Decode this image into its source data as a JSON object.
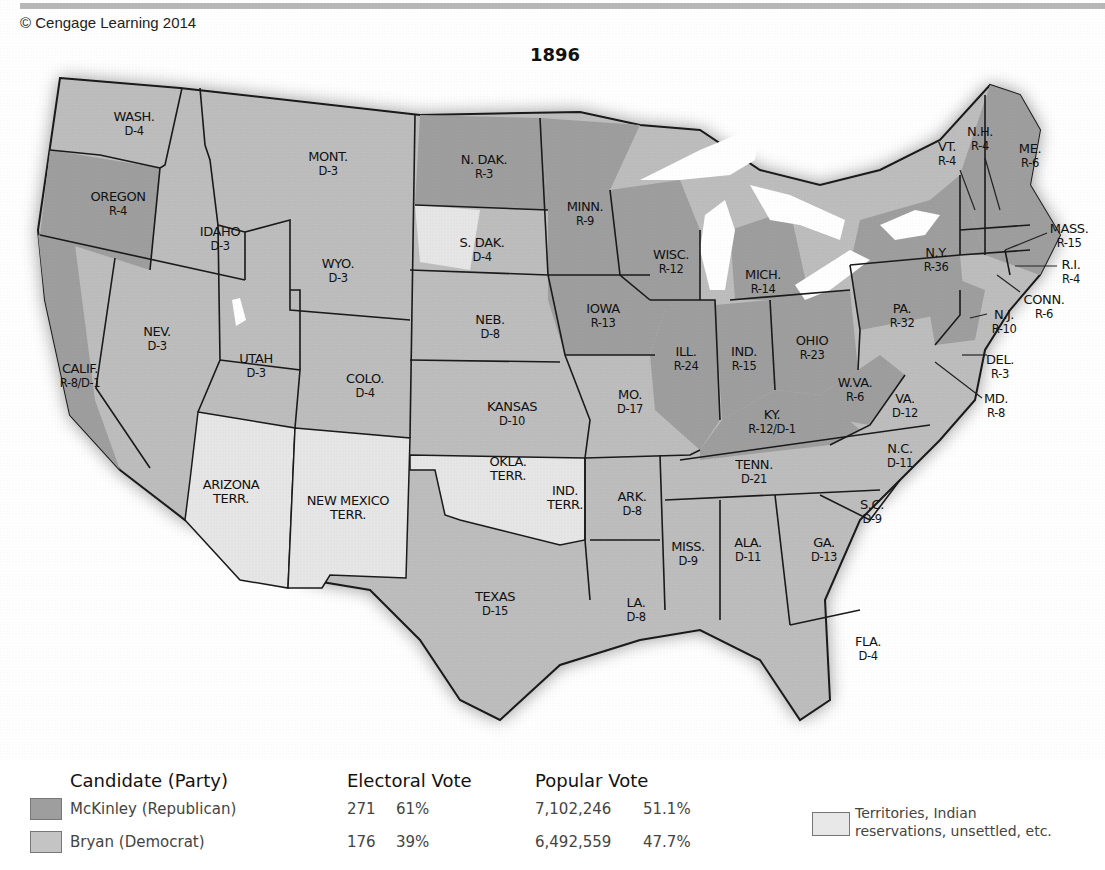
{
  "header": {
    "copyright": "© Cengage Learning 2014"
  },
  "map": {
    "title": "1896",
    "colors": {
      "republican": "#9e9e9e",
      "democrat": "#bdbdbd",
      "territory": "#e6e6e6",
      "water": "#ffffff",
      "border": "#1a1a1a"
    },
    "states": [
      {
        "name": "WASH.",
        "result": "D-4"
      },
      {
        "name": "OREGON",
        "result": "R-4"
      },
      {
        "name": "CALIF.",
        "result": "R-8/D-1"
      },
      {
        "name": "IDAHO",
        "result": "D-3"
      },
      {
        "name": "NEV.",
        "result": "D-3"
      },
      {
        "name": "MONT.",
        "result": "D-3"
      },
      {
        "name": "WYO.",
        "result": "D-3"
      },
      {
        "name": "UTAH",
        "result": "D-3"
      },
      {
        "name": "COLO.",
        "result": "D-4"
      },
      {
        "name": "ARIZONA",
        "result": "TERR."
      },
      {
        "name": "NEW MEXICO",
        "result": "TERR."
      },
      {
        "name": "N. DAK.",
        "result": "R-3"
      },
      {
        "name": "S. DAK.",
        "result": "D-4"
      },
      {
        "name": "NEB.",
        "result": "D-8"
      },
      {
        "name": "KANSAS",
        "result": "D-10"
      },
      {
        "name": "OKLA.",
        "result": "TERR."
      },
      {
        "name": "IND.",
        "result": "TERR."
      },
      {
        "name": "TEXAS",
        "result": "D-15"
      },
      {
        "name": "MINN.",
        "result": "R-9"
      },
      {
        "name": "IOWA",
        "result": "R-13"
      },
      {
        "name": "MO.",
        "result": "D-17"
      },
      {
        "name": "ARK.",
        "result": "D-8"
      },
      {
        "name": "LA.",
        "result": "D-8"
      },
      {
        "name": "WISC.",
        "result": "R-12"
      },
      {
        "name": "ILL.",
        "result": "R-24"
      },
      {
        "name": "MICH.",
        "result": "R-14"
      },
      {
        "name": "IND.",
        "result": "R-15"
      },
      {
        "name": "OHIO",
        "result": "R-23"
      },
      {
        "name": "KY.",
        "result": "R-12/D-1"
      },
      {
        "name": "TENN.",
        "result": "D-21"
      },
      {
        "name": "MISS.",
        "result": "D-9"
      },
      {
        "name": "ALA.",
        "result": "D-11"
      },
      {
        "name": "GA.",
        "result": "D-13"
      },
      {
        "name": "FLA.",
        "result": "D-4"
      },
      {
        "name": "S.C.",
        "result": "D-9"
      },
      {
        "name": "N.C.",
        "result": "D-11"
      },
      {
        "name": "VA.",
        "result": "D-12"
      },
      {
        "name": "W.VA.",
        "result": "R-6"
      },
      {
        "name": "PA.",
        "result": "R-32"
      },
      {
        "name": "N.Y.",
        "result": "R-36"
      },
      {
        "name": "VT.",
        "result": "R-4"
      },
      {
        "name": "N.H.",
        "result": "R-4"
      },
      {
        "name": "ME.",
        "result": "R-6"
      },
      {
        "name": "MASS.",
        "result": "R-15"
      },
      {
        "name": "R.I.",
        "result": "R-4"
      },
      {
        "name": "CONN.",
        "result": "R-6"
      },
      {
        "name": "N.J.",
        "result": "R-10"
      },
      {
        "name": "DEL.",
        "result": "R-3"
      },
      {
        "name": "MD.",
        "result": "R-8"
      }
    ]
  },
  "legend": {
    "headers": {
      "candidate": "Candidate (Party)",
      "electoral": "Electoral Vote",
      "popular": "Popular Vote"
    },
    "rows": [
      {
        "candidate": "McKinley (Republican)",
        "ev": "271",
        "ev_pct": "61%",
        "pv": "7,102,246",
        "pv_pct": "51.1%",
        "color": "#9e9e9e"
      },
      {
        "candidate": "Bryan (Democrat)",
        "ev": "176",
        "ev_pct": "39%",
        "pv": "6,492,559",
        "pv_pct": "47.7%",
        "color": "#c4c4c4"
      }
    ],
    "territories": {
      "line1": "Territories, Indian",
      "line2": "reservations, unsettled, etc.",
      "color": "#e8e8e8"
    }
  }
}
